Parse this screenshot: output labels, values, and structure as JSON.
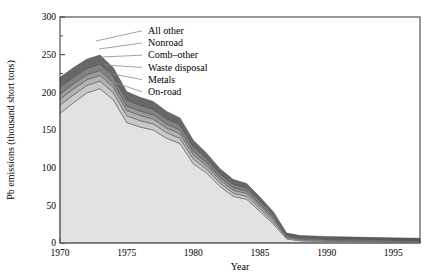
{
  "chart_data": {
    "type": "area",
    "stacked": true,
    "title": "",
    "xlabel": "Year",
    "ylabel": "Pb emissions (thousand short tons)",
    "xlim": [
      1970,
      1997
    ],
    "ylim": [
      0,
      300
    ],
    "ytick_values": [
      0,
      50,
      100,
      150,
      200,
      250,
      300
    ],
    "ytick_labels": [
      "0",
      "50",
      "100",
      "150",
      "200",
      "250",
      "300"
    ],
    "xtick_values": [
      1970,
      1975,
      1980,
      1985,
      1990,
      1995
    ],
    "xtick_labels": [
      "1970",
      "1975",
      "1980",
      "1985",
      "1990",
      "1995"
    ],
    "minor_xticks": true,
    "minor_yticks": true,
    "grid": false,
    "legend_position": "inline-leader-lines",
    "x": [
      1970,
      1971,
      1972,
      1973,
      1974,
      1975,
      1976,
      1977,
      1978,
      1979,
      1980,
      1981,
      1982,
      1983,
      1984,
      1985,
      1986,
      1987,
      1988,
      1989,
      1990,
      1991,
      1992,
      1993,
      1994,
      1995,
      1996,
      1997
    ],
    "series": [
      {
        "name": "On-road",
        "color": "#e2e2e0",
        "values": [
          172,
          186,
          199,
          205,
          190,
          160,
          154,
          150,
          139,
          132,
          105,
          93,
          75,
          62,
          58,
          42,
          25,
          5.5,
          2.8,
          2.4,
          2.2,
          2.0,
          1.9,
          1.8,
          1.7,
          1.6,
          1.5,
          1.4
        ]
      },
      {
        "name": "Metals",
        "color": "#c9c9c7",
        "values": [
          11,
          10.5,
          10,
          10,
          9.5,
          9,
          8.5,
          8,
          7.5,
          7,
          6.5,
          5,
          4.5,
          4.2,
          4,
          3.6,
          3.2,
          1.6,
          1.5,
          1.4,
          1.3,
          1.25,
          1.2,
          1.15,
          1.1,
          1.05,
          1.0,
          1.0
        ]
      },
      {
        "name": "Waste disposal",
        "color": "#b3b3b1",
        "values": [
          8,
          7.8,
          7.6,
          7.5,
          7.2,
          7,
          6.8,
          6.5,
          6.2,
          6,
          5.5,
          4.6,
          4.2,
          4.0,
          3.8,
          3.4,
          3.0,
          1.4,
          1.3,
          1.2,
          1.15,
          1.1,
          1.05,
          1.0,
          0.95,
          0.9,
          0.9,
          0.85
        ]
      },
      {
        "name": "Comb–other",
        "color": "#9b9b99",
        "values": [
          7,
          6.8,
          6.6,
          6.5,
          6.2,
          6,
          5.8,
          5.6,
          5.3,
          5.1,
          4.7,
          4.0,
          3.6,
          3.4,
          3.2,
          2.9,
          2.5,
          1.2,
          1.1,
          1.05,
          1.0,
          0.95,
          0.9,
          0.88,
          0.85,
          0.8,
          0.78,
          0.75
        ]
      },
      {
        "name": "Nonroad",
        "color": "#828280",
        "values": [
          9,
          8.8,
          8.6,
          8.5,
          8.2,
          8,
          7.7,
          7.4,
          7.0,
          6.7,
          6.2,
          5.3,
          4.8,
          4.5,
          4.2,
          3.8,
          3.3,
          1.5,
          1.4,
          1.35,
          1.3,
          1.25,
          1.2,
          1.15,
          1.1,
          1.05,
          1.0,
          1.0
        ]
      },
      {
        "name": "All other",
        "color": "#686866",
        "values": [
          13,
          12.6,
          12.2,
          12.0,
          11.5,
          11,
          10.6,
          10.2,
          9.7,
          9.2,
          8.5,
          7.2,
          6.5,
          6.1,
          5.8,
          5.2,
          4.5,
          2.0,
          1.9,
          1.8,
          1.7,
          1.65,
          1.6,
          1.55,
          1.5,
          1.45,
          1.4,
          1.35
        ]
      }
    ],
    "totals": [
      220,
      232.5,
      244,
      249.5,
      232.6,
      201,
      193.4,
      187.7,
      174.7,
      166,
      136.4,
      119.1,
      98.6,
      84.2,
      79,
      60.9,
      41.5,
      13.2,
      10,
      9.2,
      8.65,
      8.2,
      7.85,
      7.53,
      7.2,
      6.85,
      6.58,
      6.35
    ]
  },
  "legend": {
    "items": [
      {
        "label": "All other"
      },
      {
        "label": "Nonroad"
      },
      {
        "label": "Comb–other"
      },
      {
        "label": "Waste disposal"
      },
      {
        "label": "Metals"
      },
      {
        "label": "On-road"
      }
    ]
  }
}
